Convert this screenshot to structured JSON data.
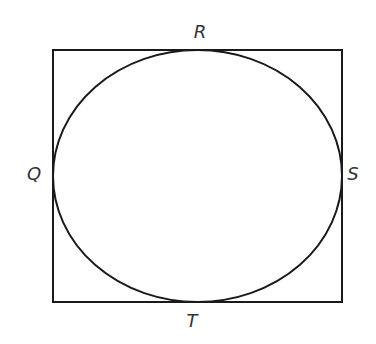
{
  "diagram": {
    "stroke_color": "#1a1a1a",
    "label_color": "#333333",
    "rectangle": {
      "x": 53,
      "y": 50,
      "width": 289,
      "height": 252
    },
    "ellipse": {
      "cx": 197.5,
      "cy": 176,
      "rx": 144.5,
      "ry": 126
    },
    "labels": {
      "top": "R",
      "left": "Q",
      "right": "S",
      "bottom": "T"
    }
  }
}
